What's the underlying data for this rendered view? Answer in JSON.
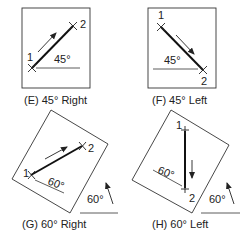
{
  "panels": [
    {
      "id": "E",
      "caption": "(E) 45° Right",
      "angle_label": "45°",
      "start": "1",
      "end": "2"
    },
    {
      "id": "F",
      "caption": "(F) 45° Left",
      "angle_label": "45°",
      "start": "1",
      "end": "2"
    },
    {
      "id": "G",
      "caption": "(G) 60° Right",
      "angle_label": "60°",
      "rotation_label": "60°",
      "start": "1",
      "end": "2"
    },
    {
      "id": "H",
      "caption": "(H) 60° Left",
      "angle_label": "60°",
      "rotation_label": "60°",
      "start": "1",
      "end": "2"
    }
  ],
  "colors": {
    "stroke": "#222222",
    "background": "#ffffff"
  }
}
